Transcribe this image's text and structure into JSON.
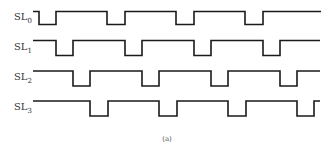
{
  "diagram": {
    "caption": "(a)",
    "stroke_color": "#1a1a1a",
    "signals": [
      {
        "name": "SL",
        "subscript": "0",
        "label_y": 20,
        "high_y": 11.5,
        "low_y": 24.5,
        "start_x": 33,
        "end_x": 321,
        "start_level": "high",
        "edges": [
          39,
          56,
          107,
          125,
          176,
          194,
          245,
          263
        ]
      },
      {
        "name": "SL",
        "subscript": "1",
        "label_y": 50,
        "high_y": 40.5,
        "low_y": 55.5,
        "start_x": 33,
        "end_x": 320,
        "start_level": "high",
        "edges": [
          56,
          73,
          125,
          142,
          194,
          211,
          263,
          280
        ]
      },
      {
        "name": "SL",
        "subscript": "2",
        "label_y": 80,
        "high_y": 71,
        "low_y": 86,
        "start_x": 33,
        "end_x": 320,
        "start_level": "high",
        "edges": [
          73,
          90,
          142,
          159,
          211,
          228,
          280,
          297
        ]
      },
      {
        "name": "SL",
        "subscript": "3",
        "label_y": 110,
        "high_y": 101,
        "low_y": 116,
        "start_x": 33,
        "end_x": 320,
        "start_level": "high",
        "edges": [
          90,
          108,
          159,
          177,
          228,
          246,
          297,
          314
        ]
      }
    ]
  }
}
